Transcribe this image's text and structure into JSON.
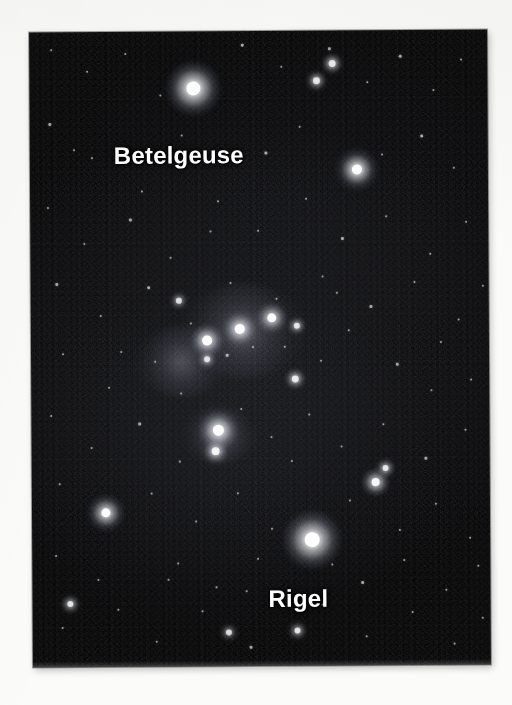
{
  "figure": {
    "kind": "astrophotograph",
    "background_color": "#fbfbfa",
    "sky_color": "#050506"
  },
  "photo": {
    "left": 31,
    "top": 31,
    "width": 458,
    "height": 635
  },
  "labels": [
    {
      "id": "betelgeuse",
      "text": "Betelgeuse",
      "color": "#ffffff",
      "x": 84,
      "y": 110,
      "font_size": 24
    },
    {
      "id": "rigel",
      "text": "Rigel",
      "color": "#ffffff",
      "x": 236,
      "y": 554,
      "font_size": 24
    }
  ],
  "chart_data": {
    "type": "scatter",
    "xlabel": "",
    "ylabel": "",
    "xlim": [
      0,
      458
    ],
    "ylim": [
      0,
      635
    ],
    "grid": false,
    "legend": "none",
    "annotations": [
      "Betelgeuse",
      "Rigel"
    ],
    "note": "Star positions are in photo-local pixel coordinates; r = rendered core radius in px, glow = halo diameter in px, mag = relative visual brightness 0-1.",
    "series": [
      {
        "name": "named stars",
        "points": [
          {
            "label": "Betelgeuse",
            "x": 164,
            "y": 57,
            "r": 7.0,
            "glow": 58,
            "mag": 1.0
          },
          {
            "label": "Rigel",
            "x": 280,
            "y": 509,
            "r": 7.5,
            "glow": 62,
            "mag": 1.0
          }
        ]
      },
      {
        "name": "bright stars",
        "points": [
          {
            "label": "Bellatrix",
            "x": 327,
            "y": 139,
            "r": 5.0,
            "glow": 46,
            "mag": 0.85
          },
          {
            "label": "Saiph",
            "x": 74,
            "y": 481,
            "r": 4.6,
            "glow": 40,
            "mag": 0.8
          },
          {
            "label": "Alnitak",
            "x": 176,
            "y": 309,
            "r": 4.8,
            "glow": 34,
            "mag": 0.82
          },
          {
            "label": "Alnilam",
            "x": 209,
            "y": 298,
            "r": 5.2,
            "glow": 32,
            "mag": 0.86
          },
          {
            "label": "Mintaka",
            "x": 241,
            "y": 287,
            "r": 4.6,
            "glow": 30,
            "mag": 0.8
          },
          {
            "label": "Orion Nebula",
            "x": 187,
            "y": 399,
            "r": 5.6,
            "glow": 40,
            "mag": 0.9
          },
          {
            "label": "Hatysa",
            "x": 184,
            "y": 420,
            "r": 4.0,
            "glow": 24,
            "mag": 0.72
          },
          {
            "label": "Eta Leporis",
            "x": 344,
            "y": 452,
            "r": 4.2,
            "glow": 30,
            "mag": 0.75
          },
          {
            "label": "Pi3 Orionis",
            "x": 354,
            "y": 438,
            "r": 3.2,
            "glow": 18,
            "mag": 0.62
          },
          {
            "label": "Meissa",
            "x": 303,
            "y": 33,
            "r": 3.6,
            "glow": 20,
            "mag": 0.66
          },
          {
            "label": "Phi Orionis",
            "x": 287,
            "y": 50,
            "r": 3.4,
            "glow": 18,
            "mag": 0.64
          },
          {
            "label": "Tau Orionis",
            "x": 266,
            "y": 295,
            "r": 3.0,
            "glow": 16,
            "mag": 0.6
          },
          {
            "label": "Lambda Leporis",
            "x": 264,
            "y": 348,
            "r": 3.4,
            "glow": 20,
            "mag": 0.64
          },
          {
            "label": "Rho Orionis",
            "x": 148,
            "y": 269,
            "r": 2.8,
            "glow": 14,
            "mag": 0.56
          },
          {
            "label": "Eta Orionis",
            "x": 176,
            "y": 328,
            "r": 3.0,
            "glow": 15,
            "mag": 0.58
          },
          {
            "label": "Delta Leporis",
            "x": 38,
            "y": 572,
            "r": 3.2,
            "glow": 18,
            "mag": 0.6
          },
          {
            "label": "Mu Leporis",
            "x": 265,
            "y": 600,
            "r": 3.2,
            "glow": 16,
            "mag": 0.6
          },
          {
            "label": "Epsilon Leporis",
            "x": 196,
            "y": 601,
            "r": 2.8,
            "glow": 13,
            "mag": 0.55
          }
        ]
      },
      {
        "name": "field stars",
        "points": [
          {
            "x": 22,
            "y": 18,
            "r": 1.0,
            "mag": 0.3
          },
          {
            "x": 58,
            "y": 40,
            "r": 1.2,
            "mag": 0.34
          },
          {
            "x": 96,
            "y": 22,
            "r": 0.9,
            "mag": 0.28
          },
          {
            "x": 131,
            "y": 64,
            "r": 1.1,
            "mag": 0.32
          },
          {
            "x": 213,
            "y": 14,
            "r": 1.4,
            "mag": 0.4
          },
          {
            "x": 252,
            "y": 36,
            "r": 1.0,
            "mag": 0.3
          },
          {
            "x": 300,
            "y": 18,
            "r": 1.3,
            "mag": 0.36
          },
          {
            "x": 338,
            "y": 52,
            "r": 1.1,
            "mag": 0.32
          },
          {
            "x": 371,
            "y": 26,
            "r": 1.5,
            "mag": 0.42
          },
          {
            "x": 404,
            "y": 60,
            "r": 1.0,
            "mag": 0.3
          },
          {
            "x": 432,
            "y": 30,
            "r": 1.2,
            "mag": 0.34
          },
          {
            "x": 20,
            "y": 92,
            "r": 1.3,
            "mag": 0.36
          },
          {
            "x": 62,
            "y": 126,
            "r": 0.9,
            "mag": 0.28
          },
          {
            "x": 112,
            "y": 160,
            "r": 1.1,
            "mag": 0.32
          },
          {
            "x": 152,
            "y": 104,
            "r": 1.0,
            "mag": 0.3
          },
          {
            "x": 236,
            "y": 122,
            "r": 1.4,
            "mag": 0.4
          },
          {
            "x": 270,
            "y": 96,
            "r": 1.0,
            "mag": 0.3
          },
          {
            "x": 392,
            "y": 106,
            "r": 1.6,
            "mag": 0.44
          },
          {
            "x": 424,
            "y": 138,
            "r": 1.1,
            "mag": 0.32
          },
          {
            "x": 18,
            "y": 176,
            "r": 1.2,
            "mag": 0.34
          },
          {
            "x": 54,
            "y": 212,
            "r": 1.0,
            "mag": 0.3
          },
          {
            "x": 100,
            "y": 188,
            "r": 1.3,
            "mag": 0.36
          },
          {
            "x": 140,
            "y": 226,
            "r": 0.9,
            "mag": 0.28
          },
          {
            "x": 188,
            "y": 170,
            "r": 1.1,
            "mag": 0.32
          },
          {
            "x": 228,
            "y": 200,
            "r": 1.2,
            "mag": 0.34
          },
          {
            "x": 276,
            "y": 168,
            "r": 1.0,
            "mag": 0.3
          },
          {
            "x": 312,
            "y": 208,
            "r": 1.4,
            "mag": 0.4
          },
          {
            "x": 356,
            "y": 186,
            "r": 1.0,
            "mag": 0.3
          },
          {
            "x": 400,
            "y": 224,
            "r": 1.2,
            "mag": 0.34
          },
          {
            "x": 436,
            "y": 192,
            "r": 1.1,
            "mag": 0.32
          },
          {
            "x": 26,
            "y": 252,
            "r": 1.3,
            "mag": 0.36
          },
          {
            "x": 70,
            "y": 284,
            "r": 1.0,
            "mag": 0.3
          },
          {
            "x": 118,
            "y": 256,
            "r": 1.5,
            "mag": 0.42
          },
          {
            "x": 160,
            "y": 292,
            "r": 1.0,
            "mag": 0.3
          },
          {
            "x": 200,
            "y": 252,
            "r": 1.1,
            "mag": 0.32
          },
          {
            "x": 246,
            "y": 268,
            "r": 1.2,
            "mag": 0.34
          },
          {
            "x": 292,
            "y": 246,
            "r": 1.0,
            "mag": 0.3
          },
          {
            "x": 340,
            "y": 276,
            "r": 1.3,
            "mag": 0.36
          },
          {
            "x": 384,
            "y": 252,
            "r": 1.1,
            "mag": 0.32
          },
          {
            "x": 428,
            "y": 290,
            "r": 1.2,
            "mag": 0.34
          },
          {
            "x": 32,
            "y": 322,
            "r": 1.0,
            "mag": 0.3
          },
          {
            "x": 78,
            "y": 356,
            "r": 1.2,
            "mag": 0.34
          },
          {
            "x": 124,
            "y": 330,
            "r": 0.9,
            "mag": 0.28
          },
          {
            "x": 150,
            "y": 362,
            "r": 1.1,
            "mag": 0.32
          },
          {
            "x": 196,
            "y": 324,
            "r": 1.4,
            "mag": 0.4
          },
          {
            "x": 222,
            "y": 316,
            "r": 1.0,
            "mag": 0.3
          },
          {
            "x": 254,
            "y": 316,
            "r": 1.2,
            "mag": 0.34
          },
          {
            "x": 290,
            "y": 330,
            "r": 1.0,
            "mag": 0.3
          },
          {
            "x": 318,
            "y": 300,
            "r": 1.1,
            "mag": 0.32
          },
          {
            "x": 366,
            "y": 334,
            "r": 1.3,
            "mag": 0.36
          },
          {
            "x": 410,
            "y": 312,
            "r": 1.0,
            "mag": 0.3
          },
          {
            "x": 440,
            "y": 350,
            "r": 1.1,
            "mag": 0.32
          },
          {
            "x": 20,
            "y": 384,
            "r": 1.2,
            "mag": 0.34
          },
          {
            "x": 60,
            "y": 416,
            "r": 1.0,
            "mag": 0.3
          },
          {
            "x": 108,
            "y": 392,
            "r": 1.3,
            "mag": 0.36
          },
          {
            "x": 148,
            "y": 430,
            "r": 0.9,
            "mag": 0.28
          },
          {
            "x": 210,
            "y": 378,
            "r": 1.1,
            "mag": 0.32
          },
          {
            "x": 240,
            "y": 406,
            "r": 1.0,
            "mag": 0.3
          },
          {
            "x": 278,
            "y": 384,
            "r": 1.2,
            "mag": 0.34
          },
          {
            "x": 310,
            "y": 416,
            "r": 1.0,
            "mag": 0.3
          },
          {
            "x": 352,
            "y": 394,
            "r": 1.1,
            "mag": 0.32
          },
          {
            "x": 394,
            "y": 428,
            "r": 1.3,
            "mag": 0.36
          },
          {
            "x": 434,
            "y": 400,
            "r": 1.0,
            "mag": 0.3
          },
          {
            "x": 28,
            "y": 452,
            "r": 1.1,
            "mag": 0.32
          },
          {
            "x": 120,
            "y": 462,
            "r": 1.2,
            "mag": 0.34
          },
          {
            "x": 164,
            "y": 490,
            "r": 0.9,
            "mag": 0.28
          },
          {
            "x": 206,
            "y": 462,
            "r": 1.0,
            "mag": 0.3
          },
          {
            "x": 240,
            "y": 498,
            "r": 1.1,
            "mag": 0.32
          },
          {
            "x": 318,
            "y": 470,
            "r": 1.0,
            "mag": 0.3
          },
          {
            "x": 368,
            "y": 500,
            "r": 1.2,
            "mag": 0.34
          },
          {
            "x": 404,
            "y": 474,
            "r": 1.1,
            "mag": 0.32
          },
          {
            "x": 438,
            "y": 508,
            "r": 1.0,
            "mag": 0.3
          },
          {
            "x": 24,
            "y": 524,
            "r": 1.2,
            "mag": 0.34
          },
          {
            "x": 66,
            "y": 548,
            "r": 1.0,
            "mag": 0.3
          },
          {
            "x": 146,
            "y": 532,
            "r": 1.1,
            "mag": 0.32
          },
          {
            "x": 184,
            "y": 556,
            "r": 0.9,
            "mag": 0.28
          },
          {
            "x": 226,
            "y": 528,
            "r": 1.2,
            "mag": 0.34
          },
          {
            "x": 300,
            "y": 534,
            "r": 1.0,
            "mag": 0.3
          },
          {
            "x": 330,
            "y": 552,
            "r": 1.3,
            "mag": 0.36
          },
          {
            "x": 372,
            "y": 530,
            "r": 1.0,
            "mag": 0.3
          },
          {
            "x": 414,
            "y": 560,
            "r": 1.1,
            "mag": 0.32
          },
          {
            "x": 446,
            "y": 536,
            "r": 1.0,
            "mag": 0.3
          },
          {
            "x": 30,
            "y": 596,
            "r": 1.1,
            "mag": 0.32
          },
          {
            "x": 86,
            "y": 578,
            "r": 1.2,
            "mag": 0.34
          },
          {
            "x": 124,
            "y": 610,
            "r": 1.0,
            "mag": 0.3
          },
          {
            "x": 170,
            "y": 580,
            "r": 1.1,
            "mag": 0.32
          },
          {
            "x": 218,
            "y": 616,
            "r": 1.3,
            "mag": 0.36
          },
          {
            "x": 290,
            "y": 574,
            "r": 1.0,
            "mag": 0.3
          },
          {
            "x": 334,
            "y": 606,
            "r": 1.1,
            "mag": 0.32
          },
          {
            "x": 380,
            "y": 582,
            "r": 1.0,
            "mag": 0.3
          },
          {
            "x": 422,
            "y": 614,
            "r": 1.2,
            "mag": 0.34
          },
          {
            "x": 450,
            "y": 588,
            "r": 0.9,
            "mag": 0.28
          },
          {
            "x": 44,
            "y": 118,
            "r": 0.8,
            "mag": 0.24
          },
          {
            "x": 180,
            "y": 200,
            "r": 0.8,
            "mag": 0.24
          },
          {
            "x": 260,
            "y": 430,
            "r": 0.8,
            "mag": 0.24
          },
          {
            "x": 352,
            "y": 124,
            "r": 0.8,
            "mag": 0.24
          },
          {
            "x": 400,
            "y": 360,
            "r": 0.8,
            "mag": 0.24
          },
          {
            "x": 90,
            "y": 320,
            "r": 0.8,
            "mag": 0.24
          },
          {
            "x": 136,
            "y": 548,
            "r": 0.8,
            "mag": 0.24
          },
          {
            "x": 306,
            "y": 262,
            "r": 0.8,
            "mag": 0.24
          },
          {
            "x": 214,
            "y": 560,
            "r": 0.8,
            "mag": 0.24
          },
          {
            "x": 452,
            "y": 256,
            "r": 0.8,
            "mag": 0.24
          }
        ]
      }
    ],
    "nebulae": [
      {
        "label": "Orion Nebula glow",
        "x": 188,
        "y": 404,
        "size": 72
      },
      {
        "label": "Belt nebulosity",
        "x": 212,
        "y": 300,
        "size": 120
      },
      {
        "label": "Barnard loop hint",
        "x": 150,
        "y": 330,
        "size": 90
      }
    ]
  }
}
